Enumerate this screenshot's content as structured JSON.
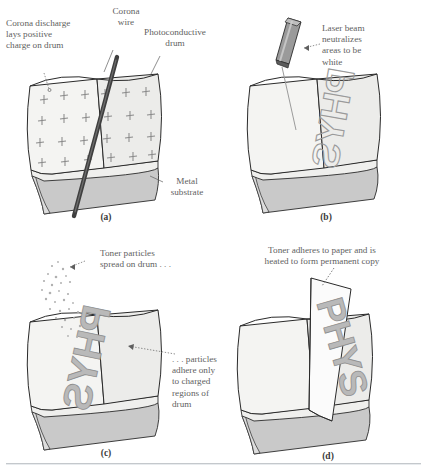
{
  "figure": {
    "colors": {
      "drum_face_light": "#f4f4f2",
      "drum_face_shaded": "#ececea",
      "metal_substrate": "#c9c9c9",
      "outline": "#2a2a2a",
      "corona_wire": "#4a4a4a",
      "text": "#5f5f5f",
      "toner": "#bdbdbd",
      "charge_mark": "#8a8a8a",
      "paper": "#fbfbfb"
    }
  },
  "panels": [
    {
      "id": "a",
      "label": "(a)",
      "annotations": [
        {
          "name": "corona-discharge-note",
          "text": "Corona discharge\nlays positive\ncharge on drum"
        },
        {
          "name": "corona-wire-note",
          "text": "Corona\nwire"
        },
        {
          "name": "photoconductive-drum-note",
          "text": "Photoconductive\ndrum"
        },
        {
          "name": "metal-substrate-note",
          "text": "Metal\nsubstrate"
        }
      ],
      "charge_symbol": "+",
      "charge_count": 24
    },
    {
      "id": "b",
      "label": "(b)",
      "annotations": [
        {
          "name": "laser-beam-note",
          "text": "Laser beam\nneutralizes\nareas to be\nwhite"
        }
      ],
      "drum_text": "PHYS"
    },
    {
      "id": "c",
      "label": "(c)",
      "annotations": [
        {
          "name": "toner-particles-note",
          "text": "Toner particles\nspread on drum . . ."
        },
        {
          "name": "particles-adhere-note",
          "text": ". . . particles\nadhere only\nto charged\nregions of\ndrum"
        }
      ],
      "drum_text": "PHYS"
    },
    {
      "id": "d",
      "label": "(d)",
      "annotations": [
        {
          "name": "toner-adheres-note",
          "text": "Toner adheres to paper and is\nheated to form permanent copy"
        }
      ],
      "paper_text": "PHYS"
    }
  ]
}
